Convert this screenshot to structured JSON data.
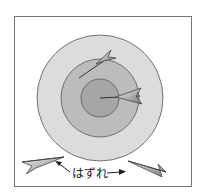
{
  "diagram": {
    "title": "",
    "miss_label": "はずれ",
    "colors": {
      "frame": "#777777",
      "outer_ring": "#dcdcdc",
      "middle_ring": "#bcbcbc",
      "bullseye": "#a6a6a6",
      "ring_stroke": "#555555",
      "dart": "#888888"
    },
    "target": {
      "center": [
        100,
        98
      ],
      "rings": [
        {
          "name": "outer",
          "radius": 63
        },
        {
          "name": "middle",
          "radius": 39
        },
        {
          "name": "bullseye",
          "radius": 19
        }
      ]
    },
    "darts": [
      {
        "name": "dart-middle-ring",
        "status": "hit"
      },
      {
        "name": "dart-bullseye",
        "status": "hit"
      },
      {
        "name": "dart-miss-left",
        "status": "miss"
      },
      {
        "name": "dart-miss-right",
        "status": "miss"
      }
    ]
  }
}
